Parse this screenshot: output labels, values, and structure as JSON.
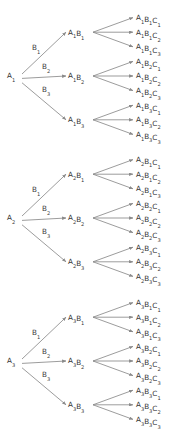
{
  "diagram": {
    "type": "tree",
    "background_color": "#ffffff",
    "line_color": "#8a8a8a",
    "text_color": "#333333",
    "levels": 3,
    "branch_labels": [
      "B1",
      "B2",
      "B3"
    ],
    "branch_label_display": [
      {
        "base": "B",
        "sub": "1"
      },
      {
        "base": "B",
        "sub": "2"
      },
      {
        "base": "B",
        "sub": "3"
      }
    ],
    "groups": [
      {
        "root": {
          "base": "A",
          "sub": "1",
          "text": "A1"
        },
        "branch_labels": [
          {
            "base": "B",
            "sub": "1"
          },
          {
            "base": "B",
            "sub": "2"
          },
          {
            "base": "B",
            "sub": "3"
          }
        ],
        "mid_nodes": [
          {
            "text": "A1B1",
            "parts": [
              {
                "base": "A",
                "sub": "1"
              },
              {
                "base": "B",
                "sub": "1"
              }
            ]
          },
          {
            "text": "A1B2",
            "parts": [
              {
                "base": "A",
                "sub": "1"
              },
              {
                "base": "B",
                "sub": "2"
              }
            ]
          },
          {
            "text": "A1B3",
            "parts": [
              {
                "base": "A",
                "sub": "1"
              },
              {
                "base": "B",
                "sub": "3"
              }
            ]
          }
        ],
        "leaves": [
          {
            "text": "A1B1C1",
            "parts": [
              {
                "base": "A",
                "sub": "1"
              },
              {
                "base": "B",
                "sub": "1"
              },
              {
                "base": "C",
                "sub": "1"
              }
            ]
          },
          {
            "text": "A1B1C2",
            "parts": [
              {
                "base": "A",
                "sub": "1"
              },
              {
                "base": "B",
                "sub": "1"
              },
              {
                "base": "C",
                "sub": "2"
              }
            ]
          },
          {
            "text": "A1B1C3",
            "parts": [
              {
                "base": "A",
                "sub": "1"
              },
              {
                "base": "B",
                "sub": "1"
              },
              {
                "base": "C",
                "sub": "3"
              }
            ]
          },
          {
            "text": "A1B2C1",
            "parts": [
              {
                "base": "A",
                "sub": "1"
              },
              {
                "base": "B",
                "sub": "2"
              },
              {
                "base": "C",
                "sub": "1"
              }
            ]
          },
          {
            "text": "A1B2C2",
            "parts": [
              {
                "base": "A",
                "sub": "1"
              },
              {
                "base": "B",
                "sub": "2"
              },
              {
                "base": "C",
                "sub": "2"
              }
            ]
          },
          {
            "text": "A1B2C3",
            "parts": [
              {
                "base": "A",
                "sub": "1"
              },
              {
                "base": "B",
                "sub": "2"
              },
              {
                "base": "C",
                "sub": "3"
              }
            ]
          },
          {
            "text": "A1B3C1",
            "parts": [
              {
                "base": "A",
                "sub": "1"
              },
              {
                "base": "B",
                "sub": "3"
              },
              {
                "base": "C",
                "sub": "1"
              }
            ]
          },
          {
            "text": "A1B3C2",
            "parts": [
              {
                "base": "A",
                "sub": "1"
              },
              {
                "base": "B",
                "sub": "3"
              },
              {
                "base": "C",
                "sub": "2"
              }
            ]
          },
          {
            "text": "A1B3C3",
            "parts": [
              {
                "base": "A",
                "sub": "1"
              },
              {
                "base": "B",
                "sub": "3"
              },
              {
                "base": "C",
                "sub": "3"
              }
            ]
          }
        ]
      },
      {
        "root": {
          "base": "A",
          "sub": "2",
          "text": "A2"
        },
        "branch_labels": [
          {
            "base": "B",
            "sub": "1"
          },
          {
            "base": "B",
            "sub": "2"
          },
          {
            "base": "B",
            "sub": "3"
          }
        ],
        "mid_nodes": [
          {
            "text": "A2B1",
            "parts": [
              {
                "base": "A",
                "sub": "2"
              },
              {
                "base": "B",
                "sub": "1"
              }
            ]
          },
          {
            "text": "A2B2",
            "parts": [
              {
                "base": "A",
                "sub": "2"
              },
              {
                "base": "B",
                "sub": "2"
              }
            ]
          },
          {
            "text": "A2B3",
            "parts": [
              {
                "base": "A",
                "sub": "2"
              },
              {
                "base": "B",
                "sub": "3"
              }
            ]
          }
        ],
        "leaves": [
          {
            "text": "A2B1C1",
            "parts": [
              {
                "base": "A",
                "sub": "2"
              },
              {
                "base": "B",
                "sub": "1"
              },
              {
                "base": "C",
                "sub": "1"
              }
            ]
          },
          {
            "text": "A2B1C2",
            "parts": [
              {
                "base": "A",
                "sub": "2"
              },
              {
                "base": "B",
                "sub": "1"
              },
              {
                "base": "C",
                "sub": "2"
              }
            ]
          },
          {
            "text": "A2B1C3",
            "parts": [
              {
                "base": "A",
                "sub": "2"
              },
              {
                "base": "B",
                "sub": "1"
              },
              {
                "base": "C",
                "sub": "3"
              }
            ]
          },
          {
            "text": "A2B2C1",
            "parts": [
              {
                "base": "A",
                "sub": "2"
              },
              {
                "base": "B",
                "sub": "2"
              },
              {
                "base": "C",
                "sub": "1"
              }
            ]
          },
          {
            "text": "A2B2C2",
            "parts": [
              {
                "base": "A",
                "sub": "2"
              },
              {
                "base": "B",
                "sub": "2"
              },
              {
                "base": "C",
                "sub": "2"
              }
            ]
          },
          {
            "text": "A2B2C3",
            "parts": [
              {
                "base": "A",
                "sub": "2"
              },
              {
                "base": "B",
                "sub": "2"
              },
              {
                "base": "C",
                "sub": "3"
              }
            ]
          },
          {
            "text": "A2B3C1",
            "parts": [
              {
                "base": "A",
                "sub": "2"
              },
              {
                "base": "B",
                "sub": "3"
              },
              {
                "base": "C",
                "sub": "1"
              }
            ]
          },
          {
            "text": "A2B3C2",
            "parts": [
              {
                "base": "A",
                "sub": "2"
              },
              {
                "base": "B",
                "sub": "3"
              },
              {
                "base": "C",
                "sub": "2"
              }
            ]
          },
          {
            "text": "A2B3C3",
            "parts": [
              {
                "base": "A",
                "sub": "2"
              },
              {
                "base": "B",
                "sub": "3"
              },
              {
                "base": "C",
                "sub": "3"
              }
            ]
          }
        ]
      },
      {
        "root": {
          "base": "A",
          "sub": "3",
          "text": "A3"
        },
        "branch_labels": [
          {
            "base": "B",
            "sub": "1"
          },
          {
            "base": "B",
            "sub": "2"
          },
          {
            "base": "B",
            "sub": "3"
          }
        ],
        "mid_nodes": [
          {
            "text": "A3B1",
            "parts": [
              {
                "base": "A",
                "sub": "3"
              },
              {
                "base": "B",
                "sub": "1"
              }
            ]
          },
          {
            "text": "A3B2",
            "parts": [
              {
                "base": "A",
                "sub": "3"
              },
              {
                "base": "B",
                "sub": "2"
              }
            ]
          },
          {
            "text": "A3B3",
            "parts": [
              {
                "base": "A",
                "sub": "3"
              },
              {
                "base": "B",
                "sub": "3"
              }
            ]
          }
        ],
        "leaves": [
          {
            "text": "A3B1C1",
            "parts": [
              {
                "base": "A",
                "sub": "3"
              },
              {
                "base": "B",
                "sub": "1"
              },
              {
                "base": "C",
                "sub": "1"
              }
            ]
          },
          {
            "text": "A3B1C2",
            "parts": [
              {
                "base": "A",
                "sub": "3"
              },
              {
                "base": "B",
                "sub": "1"
              },
              {
                "base": "C",
                "sub": "2"
              }
            ]
          },
          {
            "text": "A3B1C3",
            "parts": [
              {
                "base": "A",
                "sub": "3"
              },
              {
                "base": "B",
                "sub": "1"
              },
              {
                "base": "C",
                "sub": "3"
              }
            ]
          },
          {
            "text": "A3B2C1",
            "parts": [
              {
                "base": "A",
                "sub": "3"
              },
              {
                "base": "B",
                "sub": "2"
              },
              {
                "base": "C",
                "sub": "1"
              }
            ]
          },
          {
            "text": "A3B2C2",
            "parts": [
              {
                "base": "A",
                "sub": "3"
              },
              {
                "base": "B",
                "sub": "2"
              },
              {
                "base": "C",
                "sub": "2"
              }
            ]
          },
          {
            "text": "A3B2C3",
            "parts": [
              {
                "base": "A",
                "sub": "3"
              },
              {
                "base": "B",
                "sub": "2"
              },
              {
                "base": "C",
                "sub": "3"
              }
            ]
          },
          {
            "text": "A3B3C1",
            "parts": [
              {
                "base": "A",
                "sub": "3"
              },
              {
                "base": "B",
                "sub": "3"
              },
              {
                "base": "C",
                "sub": "1"
              }
            ]
          },
          {
            "text": "A3B3C2",
            "parts": [
              {
                "base": "A",
                "sub": "3"
              },
              {
                "base": "B",
                "sub": "3"
              },
              {
                "base": "C",
                "sub": "2"
              }
            ]
          },
          {
            "text": "A3B3C3",
            "parts": [
              {
                "base": "A",
                "sub": "3"
              },
              {
                "base": "B",
                "sub": "3"
              },
              {
                "base": "C",
                "sub": "3"
              }
            ]
          }
        ]
      }
    ],
    "layout": {
      "root_x": 13,
      "mid_x": 78,
      "leaf_x": 141,
      "group_tops": [
        20,
        162,
        305
      ],
      "mid_offsets": [
        16,
        66,
        110
      ],
      "leaf_step": 14.6,
      "label_offsets": [
        26,
        44,
        68
      ]
    }
  }
}
